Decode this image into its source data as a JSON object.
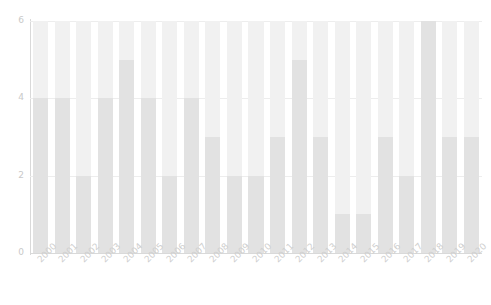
{
  "chart_data": {
    "type": "bar",
    "title": "",
    "subtitle": "",
    "xlabel": "",
    "ylabel": "",
    "ylim": [
      0,
      6
    ],
    "yticks": [
      0,
      2,
      4,
      6
    ],
    "ytick_labels": [
      "0",
      "2",
      "4",
      "6"
    ],
    "grid": true,
    "grid_axis": "y",
    "legend": false,
    "legend_position": "none",
    "stacked": true,
    "categories": [
      "2000",
      "2001",
      "2002",
      "2003",
      "2004",
      "2005",
      "2006",
      "2007",
      "2008",
      "2009",
      "2010",
      "2011",
      "2012",
      "2013",
      "2014",
      "2015",
      "2016",
      "2017",
      "2018",
      "2019",
      "2020"
    ],
    "series": [
      {
        "name": "lower",
        "color": "#e2e2e2",
        "values": [
          4,
          4,
          2,
          4,
          5,
          4,
          2,
          4,
          3,
          2,
          2,
          3,
          5,
          3,
          1,
          1,
          3,
          2,
          6,
          3,
          3
        ]
      },
      {
        "name": "upper",
        "color": "#f1f1f1",
        "values": [
          2,
          2,
          4,
          2,
          1,
          2,
          4,
          2,
          3,
          4,
          4,
          3,
          1,
          3,
          5,
          5,
          3,
          4,
          0,
          3,
          3
        ]
      }
    ],
    "totals": [
      6,
      6,
      6,
      6,
      6,
      6,
      6,
      6,
      6,
      6,
      6,
      6,
      6,
      6,
      6,
      6,
      6,
      6,
      6,
      6,
      6
    ],
    "colors": {
      "bar_lower": "#e2e2e2",
      "bar_upper": "#f1f1f1",
      "axis": "#d9d9d9",
      "grid": "#ededed",
      "tick_label": "#cbcbcb",
      "background": "#ffffff"
    }
  }
}
